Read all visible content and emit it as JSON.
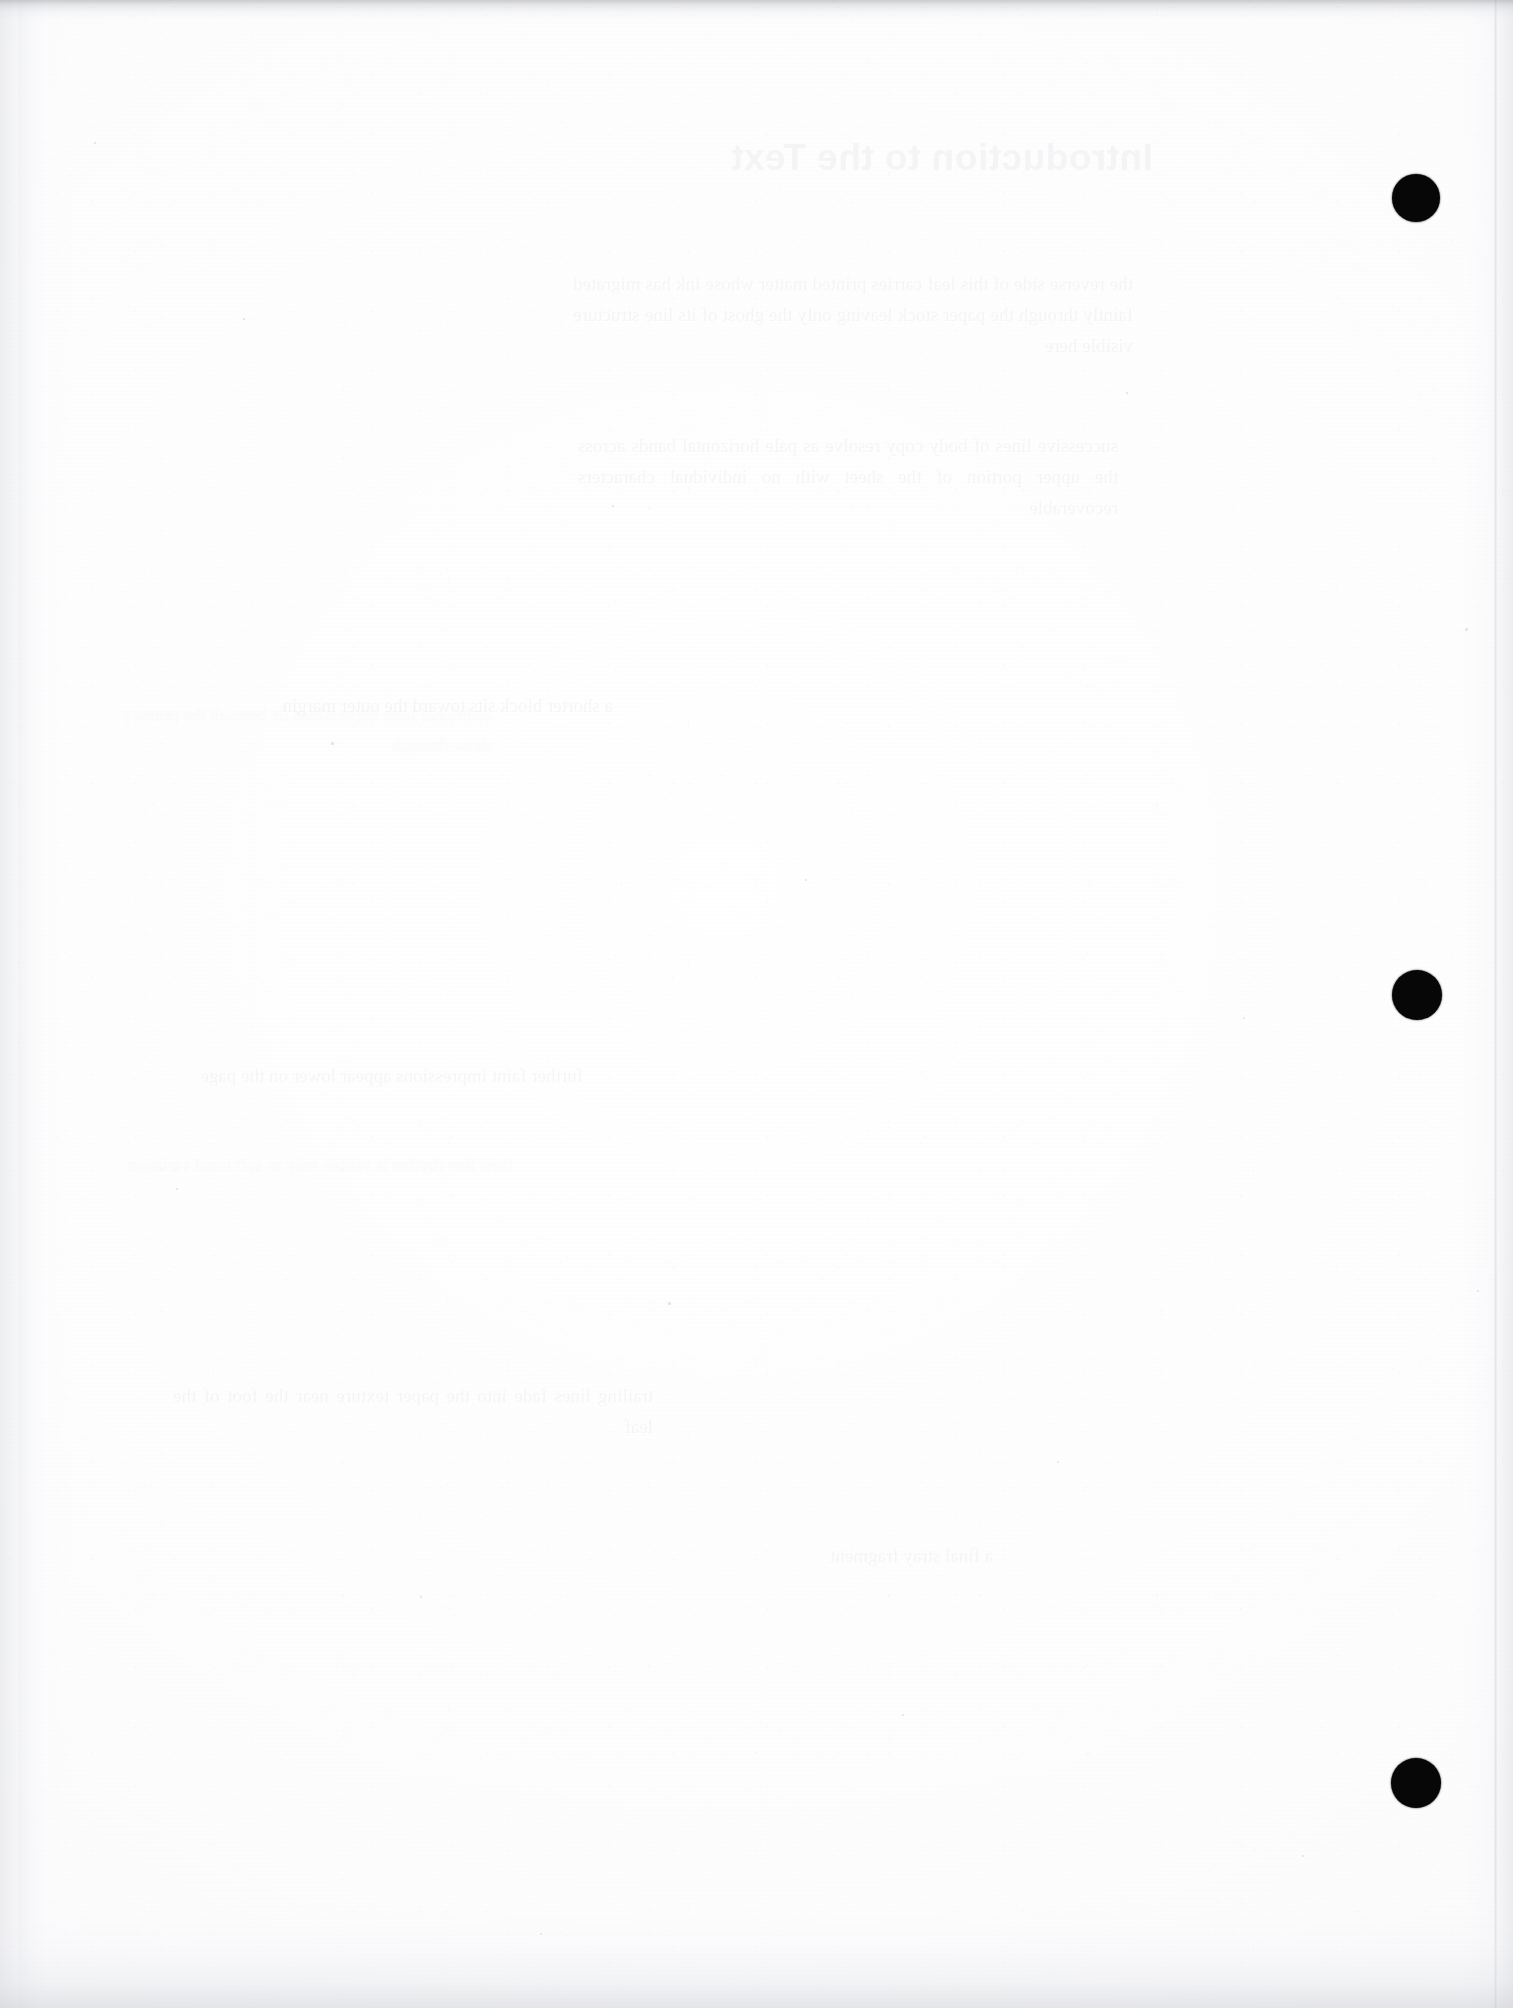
{
  "document": {
    "page_kind": "scanned-blank-verso",
    "page_width_px": 1513,
    "page_height_px": 2008,
    "background_color": "#fdfdfe",
    "ink_color": "#070707",
    "visible_text": "",
    "note_label": ""
  },
  "registration_dots": {
    "name": "registration-dots",
    "color": "#070707",
    "count": 3,
    "items": [
      {
        "id": "dot-1",
        "cx": 1416,
        "cy": 198,
        "d": 48
      },
      {
        "id": "dot-2",
        "cx": 1417,
        "cy": 995,
        "d": 50
      },
      {
        "id": "dot-3",
        "cx": 1416,
        "cy": 1783,
        "d": 50
      }
    ]
  },
  "bleed_through": {
    "description": "Mirrored show-through ink from the reverse side of the sheet; illegible at this contrast.",
    "title_ghost": "Introduction to the Text",
    "paragraphs": [
      "the reverse side of this leaf carries printed matter whose ink has migrated faintly through the paper stock leaving only the ghost of its line structure visible here",
      "successive lines of body copy resolve as pale horizontal bands across the upper portion of the sheet with no individual characters recoverable",
      "a shorter block sits toward the outer margin",
      "further faint impressions appear lower on the page",
      "trailing lines fade into the paper texture near the foot of the leaf",
      "a final stray fragment"
    ],
    "secondary": [
      "additional faint impressions lie beneath the primary show-through",
      "their line rhythm is visible only as soft tonal variation"
    ]
  },
  "scan_artifacts": {
    "top_shadow": true,
    "bottom_shadow": true,
    "left_edge_shadow": true,
    "right_edge_shadow": true,
    "page_seam_x": 1494,
    "grain": true,
    "striping": true
  },
  "specks": [
    {
      "x": 94,
      "y": 142,
      "s": 2
    },
    {
      "x": 243,
      "y": 318,
      "s": 2
    },
    {
      "x": 612,
      "y": 505,
      "s": 2
    },
    {
      "x": 1126,
      "y": 392,
      "s": 2
    },
    {
      "x": 331,
      "y": 742,
      "s": 3
    },
    {
      "x": 805,
      "y": 879,
      "s": 2
    },
    {
      "x": 1243,
      "y": 1017,
      "s": 2
    },
    {
      "x": 176,
      "y": 1188,
      "s": 2
    },
    {
      "x": 668,
      "y": 1302,
      "s": 3
    },
    {
      "x": 1057,
      "y": 1461,
      "s": 2
    },
    {
      "x": 420,
      "y": 1596,
      "s": 2
    },
    {
      "x": 902,
      "y": 1714,
      "s": 2
    },
    {
      "x": 1302,
      "y": 1855,
      "s": 2
    },
    {
      "x": 540,
      "y": 1933,
      "s": 2
    },
    {
      "x": 1465,
      "y": 628,
      "s": 3
    },
    {
      "x": 1477,
      "y": 1290,
      "s": 2
    }
  ]
}
